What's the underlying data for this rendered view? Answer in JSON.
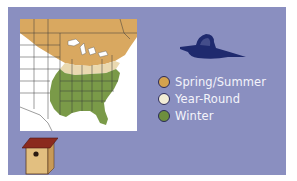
{
  "map": {
    "title": "Range map",
    "regions": [
      {
        "name": "spring-summer",
        "color": "#d9a860"
      },
      {
        "name": "year-round",
        "color": "#ead9b0"
      },
      {
        "name": "winter",
        "color": "#7a9a48"
      }
    ]
  },
  "legend": {
    "items": [
      {
        "label": "Spring/Summer",
        "color": "#d4a24e"
      },
      {
        "label": "Year-Round",
        "color": "#f2ecd6"
      },
      {
        "label": "Winter",
        "color": "#6e8f3e"
      }
    ]
  },
  "colors": {
    "panel": "#8a8fc0",
    "bird": "#1f2a6e",
    "birdhouse_roof": "#8b2a1e",
    "birdhouse_body": "#e2bf80"
  }
}
